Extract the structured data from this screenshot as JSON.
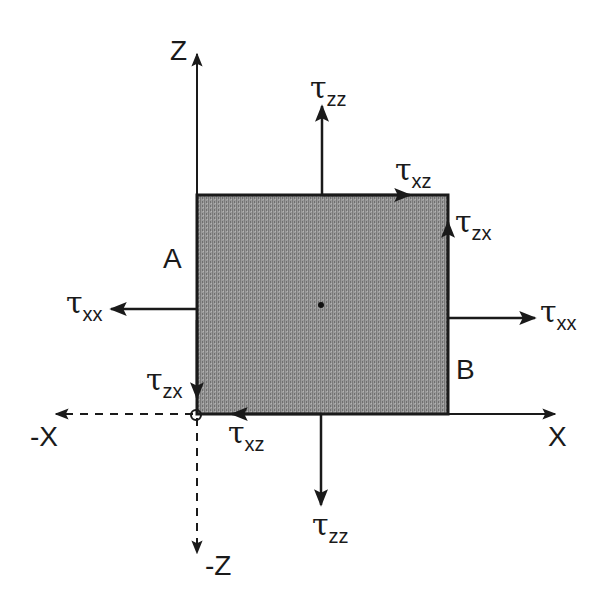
{
  "diagram": {
    "axes": {
      "z_pos": "Z",
      "z_neg": "-Z",
      "x_pos": "X",
      "x_neg": "-X"
    },
    "faces": {
      "left": "A",
      "right": "B"
    },
    "stress_labels": {
      "tau_symbol": "τ",
      "top_normal": {
        "symbol": "τ",
        "sub": "zz"
      },
      "top_shear": {
        "symbol": "τ",
        "sub": "xz"
      },
      "right_shear": {
        "symbol": "τ",
        "sub": "zx"
      },
      "left_normal": {
        "symbol": "τ",
        "sub": "xx"
      },
      "right_normal": {
        "symbol": "τ",
        "sub": "xx"
      },
      "left_shear": {
        "symbol": "τ",
        "sub": "zx"
      },
      "bottom_shear": {
        "symbol": "τ",
        "sub": "xz"
      },
      "bottom_normal": {
        "symbol": "τ",
        "sub": "zz"
      }
    },
    "colors": {
      "element_fill": "#8c8c8c",
      "stroke": "#1a1a1a"
    }
  }
}
